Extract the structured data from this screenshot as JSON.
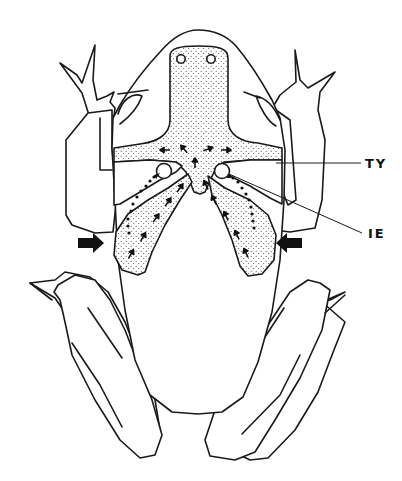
{
  "figure": {
    "labels": [
      {
        "id": "TY",
        "text": "TY"
      },
      {
        "id": "IE",
        "text": "IE"
      }
    ],
    "colors": {
      "ink": "#1a1a1a",
      "background": "#ffffff"
    },
    "elements": {
      "nostrils": 2,
      "ear_openings": 2,
      "large_block_arrows": 2
    }
  }
}
